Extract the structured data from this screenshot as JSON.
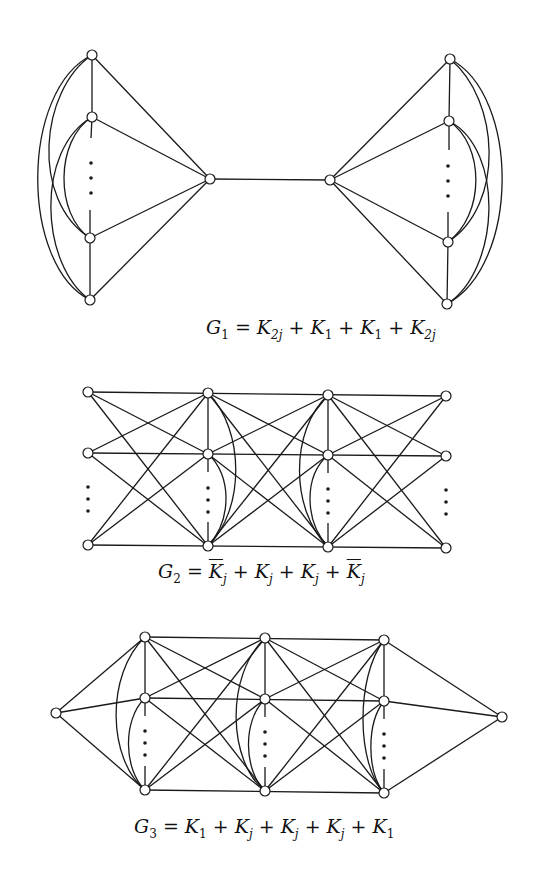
{
  "figure": {
    "graphs": [
      {
        "id": "G1",
        "caption_label": "G",
        "caption_sub": "1",
        "caption_parts": [
          {
            "sym": "K",
            "sub": "2j",
            "overline": false
          },
          {
            "sym": "K",
            "sub": "1",
            "overline": false
          },
          {
            "sym": "K",
            "sub": "1",
            "overline": false
          },
          {
            "sym": "K",
            "sub": "2j",
            "overline": false
          }
        ],
        "caption_text": "G1 = K2j + K1 + K1 + K2j"
      },
      {
        "id": "G2",
        "caption_label": "G",
        "caption_sub": "2",
        "caption_parts": [
          {
            "sym": "K",
            "sub": "j",
            "overline": true
          },
          {
            "sym": "K",
            "sub": "j",
            "overline": false
          },
          {
            "sym": "K",
            "sub": "j",
            "overline": false
          },
          {
            "sym": "K",
            "sub": "j",
            "overline": true
          }
        ],
        "caption_text": "G2 = K̄j + Kj + Kj + K̄j"
      },
      {
        "id": "G3",
        "caption_label": "G",
        "caption_sub": "3",
        "caption_parts": [
          {
            "sym": "K",
            "sub": "1",
            "overline": false
          },
          {
            "sym": "K",
            "sub": "j",
            "overline": false
          },
          {
            "sym": "K",
            "sub": "j",
            "overline": false
          },
          {
            "sym": "K",
            "sub": "j",
            "overline": false
          },
          {
            "sym": "K",
            "sub": "1",
            "overline": false
          }
        ],
        "caption_text": "G3 = K1 + Kj + Kj + Kj + K1"
      }
    ],
    "operators": {
      "eq": "=",
      "plus": "+"
    },
    "ellipsis": "⋮"
  }
}
